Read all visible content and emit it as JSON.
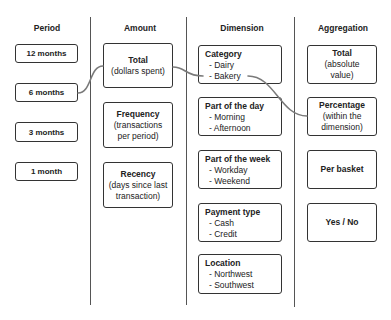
{
  "colors": {
    "text": "#222222",
    "border": "#333333",
    "divider": "#555555",
    "connector": "#7a7a7a"
  },
  "period": {
    "header": "Period",
    "items": [
      "12 months",
      "6 months",
      "3 months",
      "1 month"
    ]
  },
  "amount": {
    "header": "Amount",
    "items": [
      {
        "title": "Total",
        "desc": [
          "(dollars spent)"
        ]
      },
      {
        "title": "Frequency",
        "desc": [
          "(transactions",
          "per period)"
        ]
      },
      {
        "title": "Recency",
        "desc": [
          "(days since last",
          "transaction)"
        ]
      }
    ]
  },
  "dimension": {
    "header": "Dimension",
    "items": [
      {
        "title": "Category",
        "options": [
          "- Dairy",
          "- Bakery"
        ]
      },
      {
        "title": "Part of the day",
        "options": [
          "- Morning",
          "- Afternoon"
        ]
      },
      {
        "title": "Part of the week",
        "options": [
          "- Workday",
          "- Weekend"
        ]
      },
      {
        "title": "Payment type",
        "options": [
          "- Cash",
          "- Credit"
        ]
      },
      {
        "title": "Location",
        "options": [
          "- Northwest",
          "- Southwest"
        ]
      }
    ]
  },
  "aggregation": {
    "header": "Aggregation",
    "items": [
      {
        "title": "Total",
        "desc": [
          "(absolute",
          "value)"
        ]
      },
      {
        "title": "Percentage",
        "desc": [
          "(within the",
          "dimension)"
        ]
      },
      {
        "title": "Per basket",
        "desc": []
      },
      {
        "title": "Yes / No",
        "desc": []
      }
    ]
  },
  "connections": [
    {
      "from": "6 months",
      "to": "Total (dollars spent)"
    },
    {
      "from": "Total (dollars spent)",
      "to": "Category - Bakery"
    },
    {
      "from": "Category - Bakery",
      "to": "Percentage (within the dimension)"
    }
  ]
}
